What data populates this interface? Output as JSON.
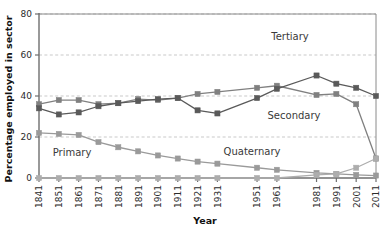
{
  "chart_data": {
    "type": "line",
    "title": "",
    "xlabel": "Year",
    "ylabel": "Percentage employed in sector",
    "categories": [
      "1841",
      "1851",
      "1861",
      "1871",
      "1881",
      "1891",
      "1901",
      "1911",
      "1921",
      "1931",
      "1951",
      "1961",
      "1981",
      "1991",
      "2001",
      "2011"
    ],
    "xlim": [
      1841,
      2011
    ],
    "ylim": [
      0,
      80
    ],
    "yticks": [
      0,
      20,
      40,
      60,
      80
    ],
    "grid": true,
    "legend_position": "inline-annotations",
    "series": [
      {
        "name": "Primary",
        "color": "#9a9a9a",
        "annotation": "Primary",
        "values": [
          22,
          21.5,
          21,
          17.5,
          15,
          13,
          11,
          9.5,
          8,
          7,
          5,
          4,
          2.5,
          2,
          1.5,
          1.2
        ]
      },
      {
        "name": "Secondary",
        "color": "#808080",
        "annotation": "Secondary",
        "values": [
          36,
          38,
          38,
          36,
          36.5,
          38.5,
          38,
          39,
          41,
          42,
          44,
          45,
          40.5,
          41,
          36,
          9.5
        ]
      },
      {
        "name": "Tertiary",
        "color": "#5a5a5a",
        "annotation": "Tertiary",
        "values": [
          34,
          31,
          32,
          35,
          36.5,
          37.5,
          38.5,
          39,
          33,
          31.5,
          39,
          43.5,
          50,
          46,
          44,
          40
        ]
      },
      {
        "name": "Quaternary",
        "color": "#adadad",
        "annotation": "Quaternary",
        "values": [
          0,
          0,
          0,
          0,
          0,
          0,
          0,
          0,
          0,
          0,
          0,
          0,
          1.5,
          2,
          5,
          9.5
        ]
      }
    ],
    "annotations": [
      {
        "label": "Tertiary",
        "x": 290,
        "y": 40
      },
      {
        "label": "Secondary",
        "x": 294,
        "y": 119
      },
      {
        "label": "Quaternary",
        "x": 252,
        "y": 155
      },
      {
        "label": "Primary",
        "x": 72,
        "y": 156
      }
    ]
  }
}
